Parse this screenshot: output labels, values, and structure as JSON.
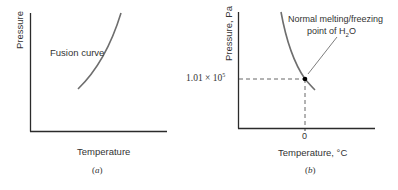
{
  "panels": [
    {
      "id": "a",
      "caption": "(a)",
      "caption_letter": "a",
      "y_axis_label": "Pressure",
      "x_axis_label": "Temperature",
      "curve_label": "Fusion curve"
    },
    {
      "id": "b",
      "caption_letter": "b",
      "y_axis_label": "Pressure, Pa",
      "x_axis_label": "Temperature, °C",
      "y_tick_mantissa": "1.01 × 10",
      "y_tick_exponent": "5",
      "x_tick": "0",
      "annotation_line1": "Normal melting/freezing",
      "annotation_line2_prefix": "point of H",
      "annotation_line2_sub": "2",
      "annotation_line2_suffix": "O"
    }
  ],
  "colors": {
    "axis": "#2b2b2b",
    "curve": "#6e6e6e",
    "dashed": "#555555",
    "point": "#000000"
  }
}
